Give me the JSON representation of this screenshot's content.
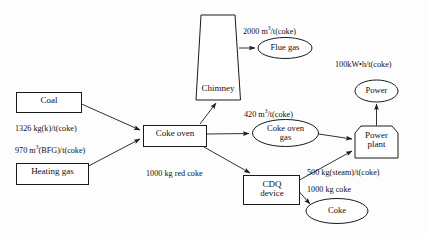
{
  "diagram": {
    "stroke_color": "#1a1a1a",
    "background_color": "#fdfdfd",
    "nodes": {
      "coal": {
        "label": "Coal",
        "shape": "rectangle"
      },
      "heating_gas": {
        "label": "Heating  gas",
        "shape": "rectangle"
      },
      "coke_oven": {
        "label": "Coke  oven",
        "shape": "rectangle"
      },
      "chimney": {
        "label": "Chimney",
        "shape": "trapezoid"
      },
      "cdq_device": {
        "label_line1": "CDQ",
        "label_line2": "device",
        "shape": "rectangle"
      },
      "power_plant": {
        "label_line1": "Power",
        "label_line2": "plant",
        "shape": "pentagon"
      },
      "flue_gas": {
        "label": "Flue  gas",
        "shape": "ellipse"
      },
      "coke_oven_gas": {
        "label_line1": "Coke  oven",
        "label_line2": "gas",
        "shape": "ellipse"
      },
      "power": {
        "label": "Power",
        "shape": "ellipse"
      },
      "coke": {
        "label": "Coke",
        "shape": "ellipse"
      }
    },
    "flows": [
      {
        "id": "coal-to-oven",
        "value": "1326",
        "unit": "kg(k)/t(coke)",
        "text": "1326 kg(k)/t(coke)"
      },
      {
        "id": "heating-gas-to-oven",
        "value": "970",
        "unit": "m3(BFG)/t(coke)",
        "text_pre": "970 m",
        "text_sup": "3",
        "text_post": "(BFG)/t(coke)"
      },
      {
        "id": "chimney-to-flue-gas",
        "value": "2000",
        "unit": "m3/t(coke)",
        "text_pre": "2000 m",
        "text_sup": "3",
        "text_post": "/t(coke)"
      },
      {
        "id": "oven-to-coke-oven-gas",
        "value": "420",
        "unit": "m3/t(coke)",
        "text_pre": "420 m",
        "text_sup": "3",
        "text_post": "/t(coke)"
      },
      {
        "id": "oven-to-cdq",
        "value": "1000",
        "unit": "kg red coke",
        "text": "1000 kg red coke"
      },
      {
        "id": "cdq-to-power-plant",
        "value": "500",
        "unit": "kg(steam)/t(coke)",
        "text": "500 kg(steam)/t(coke)"
      },
      {
        "id": "cdq-to-coke",
        "value": "1000",
        "unit": "kg coke",
        "text": "1000 kg coke"
      },
      {
        "id": "power-plant-to-power",
        "value": "100",
        "unit": "kW•h/t(coke)",
        "text": "100kW•h/t(coke)"
      }
    ]
  }
}
